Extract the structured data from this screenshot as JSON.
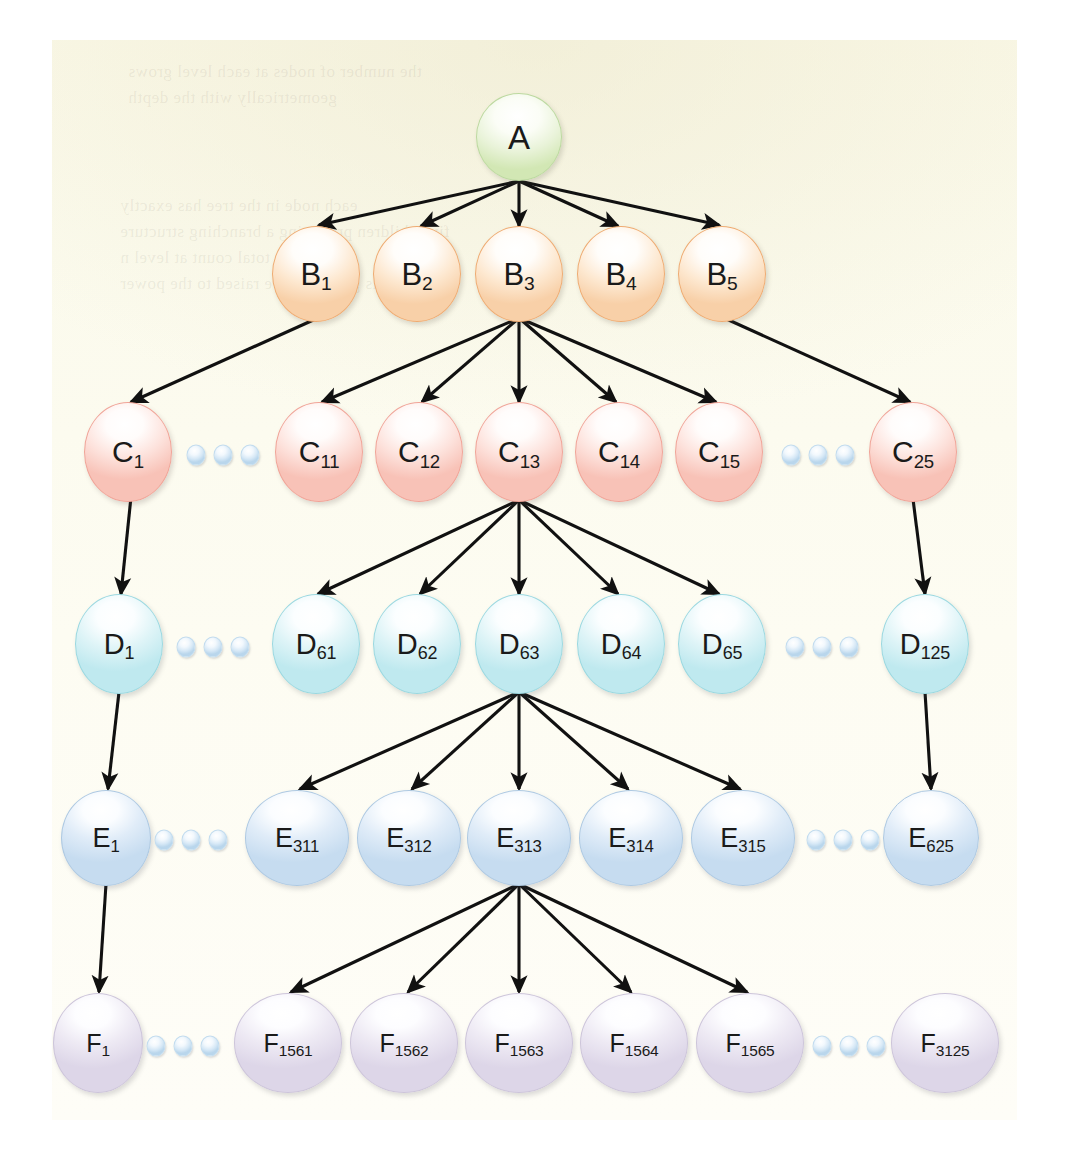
{
  "diagram": {
    "background_color": "#fbfaec",
    "page_color": "#ffffff",
    "arrow_color": "#111111",
    "levels": [
      {
        "id": "A",
        "label_prefix": "A",
        "fill_color": "#d2e7b4",
        "border_color": "#bcd9a0",
        "node_count_total": 1,
        "nodes": [
          {
            "base": "A",
            "sub": "",
            "cx": 519,
            "cy": 137,
            "rx": 43,
            "ry": 44
          }
        ],
        "dots": []
      },
      {
        "id": "B",
        "label_prefix": "B",
        "fill_color": "#f8d0a8",
        "border_color": "#eeab72",
        "node_count_total": 5,
        "nodes": [
          {
            "base": "B",
            "sub": "1",
            "cx": 316,
            "cy": 274,
            "rx": 44,
            "ry": 48
          },
          {
            "base": "B",
            "sub": "2",
            "cx": 417,
            "cy": 274,
            "rx": 44,
            "ry": 48
          },
          {
            "base": "B",
            "sub": "3",
            "cx": 519,
            "cy": 274,
            "rx": 44,
            "ry": 48
          },
          {
            "base": "B",
            "sub": "4",
            "cx": 621,
            "cy": 274,
            "rx": 44,
            "ry": 48
          },
          {
            "base": "B",
            "sub": "5",
            "cx": 722,
            "cy": 274,
            "rx": 44,
            "ry": 48
          }
        ],
        "dots": []
      },
      {
        "id": "C",
        "label_prefix": "C",
        "fill_color": "#f8c2b7",
        "border_color": "#f0a498",
        "node_count_total": 25,
        "nodes": [
          {
            "base": "C",
            "sub": "1",
            "cx": 128,
            "cy": 452,
            "rx": 44,
            "ry": 50
          },
          {
            "base": "C",
            "sub": "11",
            "cx": 319,
            "cy": 452,
            "rx": 44,
            "ry": 50
          },
          {
            "base": "C",
            "sub": "12",
            "cx": 419,
            "cy": 452,
            "rx": 44,
            "ry": 50
          },
          {
            "base": "C",
            "sub": "13",
            "cx": 519,
            "cy": 452,
            "rx": 44,
            "ry": 50
          },
          {
            "base": "C",
            "sub": "14",
            "cx": 619,
            "cy": 452,
            "rx": 44,
            "ry": 50
          },
          {
            "base": "C",
            "sub": "15",
            "cx": 719,
            "cy": 452,
            "rx": 44,
            "ry": 50
          },
          {
            "base": "C",
            "sub": "25",
            "cx": 913,
            "cy": 452,
            "rx": 44,
            "ry": 50
          }
        ],
        "dots": [
          {
            "cx": 223,
            "cy": 455
          },
          {
            "cx": 818,
            "cy": 455
          }
        ]
      },
      {
        "id": "D",
        "label_prefix": "D",
        "fill_color": "#bfe9ef",
        "border_color": "#9bd8e0",
        "node_count_total": 125,
        "nodes": [
          {
            "base": "D",
            "sub": "1",
            "cx": 119,
            "cy": 644,
            "rx": 44,
            "ry": 50
          },
          {
            "base": "D",
            "sub": "61",
            "cx": 316,
            "cy": 644,
            "rx": 44,
            "ry": 50
          },
          {
            "base": "D",
            "sub": "62",
            "cx": 417,
            "cy": 644,
            "rx": 44,
            "ry": 50
          },
          {
            "base": "D",
            "sub": "63",
            "cx": 519,
            "cy": 644,
            "rx": 44,
            "ry": 50
          },
          {
            "base": "D",
            "sub": "64",
            "cx": 621,
            "cy": 644,
            "rx": 44,
            "ry": 50
          },
          {
            "base": "D",
            "sub": "65",
            "cx": 722,
            "cy": 644,
            "rx": 44,
            "ry": 50
          },
          {
            "base": "D",
            "sub": "125",
            "cx": 925,
            "cy": 644,
            "rx": 44,
            "ry": 50
          }
        ],
        "dots": [
          {
            "cx": 213,
            "cy": 647
          },
          {
            "cx": 822,
            "cy": 647
          }
        ]
      },
      {
        "id": "E",
        "label_prefix": "E",
        "fill_color": "#c6dcf0",
        "border_color": "#aec9e2",
        "node_count_total": 625,
        "nodes": [
          {
            "base": "E",
            "sub": "1",
            "cx": 106,
            "cy": 838,
            "rx": 45,
            "ry": 48
          },
          {
            "base": "E",
            "sub": "311",
            "cx": 297,
            "cy": 838,
            "rx": 52,
            "ry": 48
          },
          {
            "base": "E",
            "sub": "312",
            "cx": 409,
            "cy": 838,
            "rx": 52,
            "ry": 48
          },
          {
            "base": "E",
            "sub": "313",
            "cx": 519,
            "cy": 838,
            "rx": 52,
            "ry": 48
          },
          {
            "base": "E",
            "sub": "314",
            "cx": 631,
            "cy": 838,
            "rx": 52,
            "ry": 48
          },
          {
            "base": "E",
            "sub": "315",
            "cx": 743,
            "cy": 838,
            "rx": 52,
            "ry": 48
          },
          {
            "base": "E",
            "sub": "625",
            "cx": 931,
            "cy": 838,
            "rx": 48,
            "ry": 48
          }
        ],
        "dots": [
          {
            "cx": 191,
            "cy": 840
          },
          {
            "cx": 843,
            "cy": 840
          }
        ]
      },
      {
        "id": "F",
        "label_prefix": "F",
        "fill_color": "#ddd6e8",
        "border_color": "#cdc5da",
        "node_count_total": 3125,
        "nodes": [
          {
            "base": "F",
            "sub": "1",
            "cx": 98,
            "cy": 1043,
            "rx": 45,
            "ry": 50
          },
          {
            "base": "F",
            "sub": "1561",
            "cx": 288,
            "cy": 1043,
            "rx": 54,
            "ry": 50
          },
          {
            "base": "F",
            "sub": "1562",
            "cx": 404,
            "cy": 1043,
            "rx": 54,
            "ry": 50
          },
          {
            "base": "F",
            "sub": "1563",
            "cx": 519,
            "cy": 1043,
            "rx": 54,
            "ry": 50
          },
          {
            "base": "F",
            "sub": "1564",
            "cx": 634,
            "cy": 1043,
            "rx": 54,
            "ry": 50
          },
          {
            "base": "F",
            "sub": "1565",
            "cx": 750,
            "cy": 1043,
            "rx": 54,
            "ry": 50
          },
          {
            "base": "F",
            "sub": "3125",
            "cx": 945,
            "cy": 1043,
            "rx": 54,
            "ry": 50
          }
        ],
        "dots": [
          {
            "cx": 183,
            "cy": 1046
          },
          {
            "cx": 849,
            "cy": 1046
          }
        ]
      }
    ],
    "edges": [
      {
        "from": "A",
        "to": "B1",
        "x1": 519,
        "y1": 181,
        "x2": 319,
        "y2": 225
      },
      {
        "from": "A",
        "to": "B2",
        "x1": 519,
        "y1": 181,
        "x2": 421,
        "y2": 226
      },
      {
        "from": "A",
        "to": "B3",
        "x1": 519,
        "y1": 181,
        "x2": 519,
        "y2": 226
      },
      {
        "from": "A",
        "to": "B4",
        "x1": 519,
        "y1": 181,
        "x2": 618,
        "y2": 226
      },
      {
        "from": "A",
        "to": "B5",
        "x1": 519,
        "y1": 181,
        "x2": 719,
        "y2": 225
      },
      {
        "from": "B1",
        "to": "C1",
        "x1": 320,
        "y1": 317,
        "x2": 131,
        "y2": 402
      },
      {
        "from": "B3",
        "to": "C11",
        "x1": 519,
        "y1": 318,
        "x2": 322,
        "y2": 402
      },
      {
        "from": "B3",
        "to": "C12",
        "x1": 519,
        "y1": 318,
        "x2": 422,
        "y2": 402
      },
      {
        "from": "B3",
        "to": "C13",
        "x1": 519,
        "y1": 318,
        "x2": 519,
        "y2": 402
      },
      {
        "from": "B3",
        "to": "C14",
        "x1": 519,
        "y1": 318,
        "x2": 616,
        "y2": 402
      },
      {
        "from": "B3",
        "to": "C15",
        "x1": 519,
        "y1": 318,
        "x2": 716,
        "y2": 402
      },
      {
        "from": "B5",
        "to": "C25",
        "x1": 722,
        "y1": 317,
        "x2": 910,
        "y2": 402
      },
      {
        "from": "C1",
        "to": "D1",
        "x1": 131,
        "y1": 497,
        "x2": 121,
        "y2": 594
      },
      {
        "from": "C13",
        "to": "D61",
        "x1": 519,
        "y1": 500,
        "x2": 318,
        "y2": 594
      },
      {
        "from": "C13",
        "to": "D62",
        "x1": 519,
        "y1": 500,
        "x2": 420,
        "y2": 594
      },
      {
        "from": "C13",
        "to": "D63",
        "x1": 519,
        "y1": 500,
        "x2": 519,
        "y2": 594
      },
      {
        "from": "C13",
        "to": "D64",
        "x1": 519,
        "y1": 500,
        "x2": 618,
        "y2": 594
      },
      {
        "from": "C13",
        "to": "D65",
        "x1": 519,
        "y1": 500,
        "x2": 719,
        "y2": 594
      },
      {
        "from": "C25",
        "to": "D125",
        "x1": 913,
        "y1": 499,
        "x2": 925,
        "y2": 594
      },
      {
        "from": "D1",
        "to": "E1",
        "x1": 119,
        "y1": 692,
        "x2": 108,
        "y2": 789
      },
      {
        "from": "D63",
        "to": "E311",
        "x1": 519,
        "y1": 692,
        "x2": 300,
        "y2": 789
      },
      {
        "from": "D63",
        "to": "E312",
        "x1": 519,
        "y1": 692,
        "x2": 412,
        "y2": 789
      },
      {
        "from": "D63",
        "to": "E313",
        "x1": 519,
        "y1": 692,
        "x2": 519,
        "y2": 789
      },
      {
        "from": "D63",
        "to": "E314",
        "x1": 519,
        "y1": 692,
        "x2": 628,
        "y2": 789
      },
      {
        "from": "D63",
        "to": "E315",
        "x1": 519,
        "y1": 692,
        "x2": 740,
        "y2": 789
      },
      {
        "from": "D125",
        "to": "E625",
        "x1": 925,
        "y1": 692,
        "x2": 931,
        "y2": 789
      },
      {
        "from": "E1",
        "to": "F1",
        "x1": 106,
        "y1": 884,
        "x2": 99,
        "y2": 992
      },
      {
        "from": "E313",
        "to": "F1561",
        "x1": 519,
        "y1": 884,
        "x2": 291,
        "y2": 992
      },
      {
        "from": "E313",
        "to": "F1562",
        "x1": 519,
        "y1": 884,
        "x2": 408,
        "y2": 992
      },
      {
        "from": "E313",
        "to": "F1563",
        "x1": 519,
        "y1": 884,
        "x2": 519,
        "y2": 992
      },
      {
        "from": "E313",
        "to": "F1564",
        "x1": 519,
        "y1": 884,
        "x2": 631,
        "y2": 992
      },
      {
        "from": "E313",
        "to": "F1565",
        "x1": 519,
        "y1": 884,
        "x2": 747,
        "y2": 992
      }
    ],
    "ghost_lines": [
      {
        "text": "the number of nodes at each level grows",
        "x": 128,
        "y": 62,
        "size": 17
      },
      {
        "text": "geometrically with the depth",
        "x": 128,
        "y": 88,
        "size": 17
      },
      {
        "text": "each node in the tree has exactly",
        "x": 120,
        "y": 196,
        "size": 17
      },
      {
        "text": "five children producing a branching structure",
        "x": 120,
        "y": 222,
        "size": 17
      },
      {
        "text": "and the total count at level n",
        "x": 120,
        "y": 248,
        "size": 17
      },
      {
        "text": "is given by five raised to the power",
        "x": 120,
        "y": 274,
        "size": 17
      }
    ]
  }
}
